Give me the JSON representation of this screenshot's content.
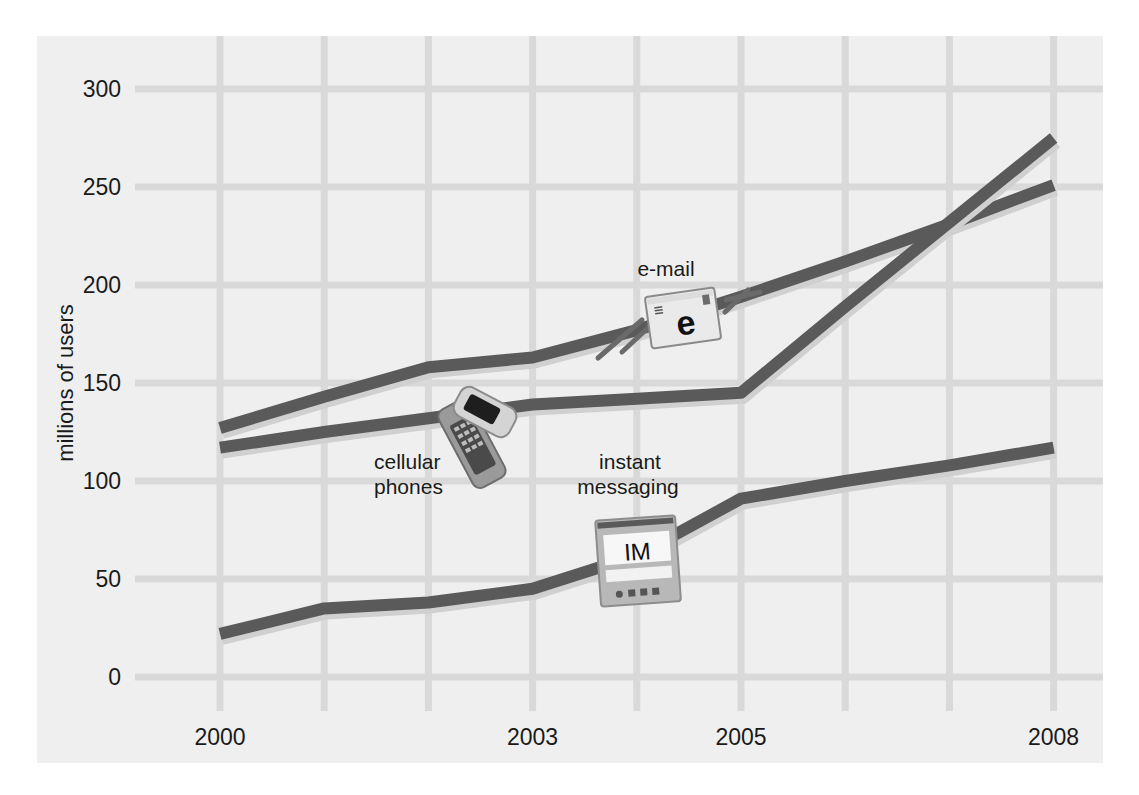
{
  "chart_data": {
    "type": "line",
    "title": "",
    "xlabel": "",
    "ylabel": "millions of users",
    "x": [
      2000,
      2001,
      2002,
      2003,
      2004,
      2005,
      2006,
      2007,
      2008
    ],
    "x_tick_labels": [
      "2000",
      "2003",
      "2005",
      "2008"
    ],
    "y_tick_labels": [
      "0",
      "50",
      "100",
      "150",
      "200",
      "250",
      "300"
    ],
    "ylim": [
      0,
      300
    ],
    "xlim": [
      2000,
      2008
    ],
    "grid": true,
    "legend": "none (series labeled inline with icons)",
    "series": [
      {
        "name": "e-mail",
        "values": [
          127,
          143,
          158,
          163,
          177,
          194,
          212,
          231,
          251
        ]
      },
      {
        "name": "cellular phones",
        "values": [
          117,
          125,
          132,
          139,
          142,
          145,
          189,
          232,
          275
        ]
      },
      {
        "name": "instant messaging",
        "values": [
          22,
          35,
          38,
          45,
          62,
          91,
          100,
          108,
          117
        ]
      }
    ],
    "annotations": [
      {
        "text": "e-mail",
        "icon": "envelope-icon",
        "icon_text": "e"
      },
      {
        "text": "cellular phones",
        "icon": "flip-phone-icon"
      },
      {
        "text": "instant messaging",
        "icon": "im-device-icon",
        "icon_text": "IM"
      }
    ]
  },
  "colors": {
    "page_background": "#ffffff",
    "panel_background": "#efefef",
    "gridline": "#d9d9d9",
    "series_line": "#5a5a5a",
    "text": "#1a1a1a"
  },
  "labels": {
    "ylabel": "millions of users",
    "email": "e-mail",
    "cellular_line1": "cellular",
    "cellular_line2": "phones",
    "im_line1": "instant",
    "im_line2": "messaging",
    "email_icon_text": "e",
    "im_icon_text": "IM"
  }
}
